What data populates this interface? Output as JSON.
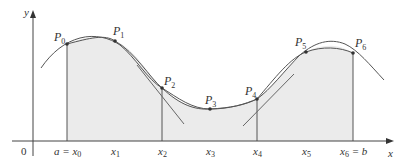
{
  "figure": {
    "type": "simpsons-rule-illustration",
    "axis_labels": {
      "x": "x",
      "y": "y",
      "origin": "0"
    },
    "points": [
      {
        "name": "P",
        "sub": "0",
        "x": 67,
        "y": 44
      },
      {
        "name": "P",
        "sub": "1",
        "x": 115,
        "y": 41
      },
      {
        "name": "P",
        "sub": "2",
        "x": 162,
        "y": 88
      },
      {
        "name": "P",
        "sub": "3",
        "x": 210,
        "y": 109
      },
      {
        "name": "P",
        "sub": "4",
        "x": 257,
        "y": 99
      },
      {
        "name": "P",
        "sub": "5",
        "x": 306,
        "y": 52
      },
      {
        "name": "P",
        "sub": "6",
        "x": 353,
        "y": 53
      }
    ],
    "ticks": [
      {
        "prefix": "a = ",
        "name": "x",
        "sub": "0",
        "x": 67
      },
      {
        "prefix": "",
        "name": "x",
        "sub": "1",
        "x": 115
      },
      {
        "prefix": "",
        "name": "x",
        "sub": "2",
        "x": 162
      },
      {
        "prefix": "",
        "name": "x",
        "sub": "3",
        "x": 210
      },
      {
        "prefix": "",
        "name": "x",
        "sub": "4",
        "x": 257
      },
      {
        "prefix": "",
        "name": "x",
        "sub": "5",
        "x": 306
      },
      {
        "prefix": "",
        "name": "x",
        "sub": "6",
        "suffix": " = b",
        "x": 353
      }
    ],
    "colors": {
      "fill": "#ebebeb",
      "line": "#555555",
      "axis": "#444444"
    }
  }
}
